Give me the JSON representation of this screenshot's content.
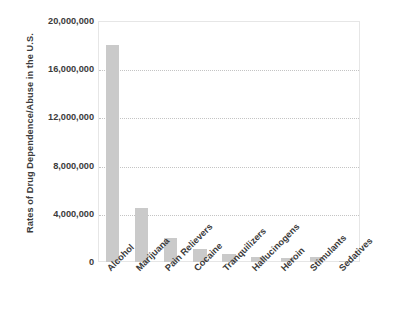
{
  "chart_data": {
    "type": "bar",
    "title": "",
    "xlabel": "",
    "ylabel": "Rates of Drug Dependence/Abuse in the U.S.",
    "categories": [
      "Alcohol",
      "Marijuana",
      "Pain Relievers",
      "Cocaine",
      "Tranquilizers",
      "Hallucinogens",
      "Heroin",
      "Stimulants",
      "Sedatives"
    ],
    "values": [
      18000000,
      4500000,
      2000000,
      1100000,
      700000,
      400000,
      300000,
      400000,
      100000
    ],
    "ylim": [
      0,
      20000000
    ],
    "ytick_values": [
      0,
      4000000,
      8000000,
      12000000,
      16000000,
      20000000
    ],
    "ytick_labels": [
      "0",
      "4,000,000",
      "8,000,000",
      "12,000,000",
      "16,000,000",
      "20,000,000"
    ],
    "grid": true,
    "gridline_style": "dotted",
    "legend": false,
    "legend_position": "none",
    "bar_color": "#cacaca",
    "text_color": "#3b3b3b",
    "grid_color": "#c4c4c4",
    "plot_border_color": "#e6e6e6",
    "background_color": "#ffffff"
  }
}
